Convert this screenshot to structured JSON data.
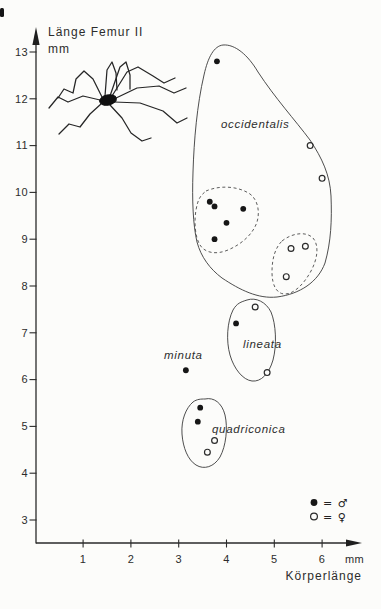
{
  "meta": {
    "background_color": "#fcfcfa",
    "ink_color": "#222222"
  },
  "chart_data": {
    "type": "scatter",
    "ylabel": "Länge Femur II",
    "y_unit": "mm",
    "xlabel": "Körperlänge",
    "x_unit": "mm",
    "xlim": [
      0,
      6.8
    ],
    "ylim": [
      2.6,
      13.6
    ],
    "x_ticks": [
      1,
      2,
      3,
      4,
      5,
      6
    ],
    "y_ticks": [
      3,
      4,
      5,
      6,
      7,
      8,
      9,
      10,
      11,
      12,
      13
    ],
    "grid": false,
    "legend": {
      "position": "bottom-right",
      "entries": [
        {
          "symbol": "filled-circle",
          "label": "= ♂",
          "meaning": "male"
        },
        {
          "symbol": "open-circle",
          "label": "= ♀",
          "meaning": "female"
        }
      ]
    },
    "series": [
      {
        "name": "occidentalis-male",
        "species": "occidentalis",
        "sex": "male",
        "symbol": "filled",
        "points": [
          [
            3.8,
            12.8
          ],
          [
            3.65,
            9.8
          ],
          [
            3.75,
            9.7
          ],
          [
            4.35,
            9.65
          ],
          [
            4.0,
            9.35
          ],
          [
            3.75,
            9.0
          ]
        ]
      },
      {
        "name": "occidentalis-female",
        "species": "occidentalis",
        "sex": "female",
        "symbol": "open",
        "points": [
          [
            5.75,
            11.0
          ],
          [
            6.0,
            10.3
          ],
          [
            5.65,
            8.85
          ],
          [
            5.35,
            8.8
          ],
          [
            5.25,
            8.2
          ]
        ]
      },
      {
        "name": "lineata-male",
        "species": "lineata",
        "sex": "male",
        "symbol": "filled",
        "points": [
          [
            4.2,
            7.2
          ]
        ]
      },
      {
        "name": "lineata-female",
        "species": "lineata",
        "sex": "female",
        "symbol": "open",
        "points": [
          [
            4.6,
            7.55
          ],
          [
            4.85,
            6.15
          ]
        ]
      },
      {
        "name": "minuta-male",
        "species": "minuta",
        "sex": "male",
        "symbol": "filled",
        "points": [
          [
            3.15,
            6.2
          ]
        ]
      },
      {
        "name": "quadriconica-male",
        "species": "quadriconica",
        "sex": "male",
        "symbol": "filled",
        "points": [
          [
            3.45,
            5.4
          ],
          [
            3.4,
            5.1
          ]
        ]
      },
      {
        "name": "quadriconica-female",
        "species": "quadriconica",
        "sex": "female",
        "symbol": "open",
        "points": [
          [
            3.75,
            4.7
          ],
          [
            3.6,
            4.45
          ]
        ]
      }
    ],
    "annotations": [
      {
        "text": "occidentalis",
        "x_px": 221,
        "y_px": 128
      },
      {
        "text": "lineata",
        "x_px": 243,
        "y_px": 348
      },
      {
        "text": "minuta",
        "x_px": 164,
        "y_px": 359
      },
      {
        "text": "quadriconica",
        "x_px": 212,
        "y_px": 433
      }
    ]
  }
}
